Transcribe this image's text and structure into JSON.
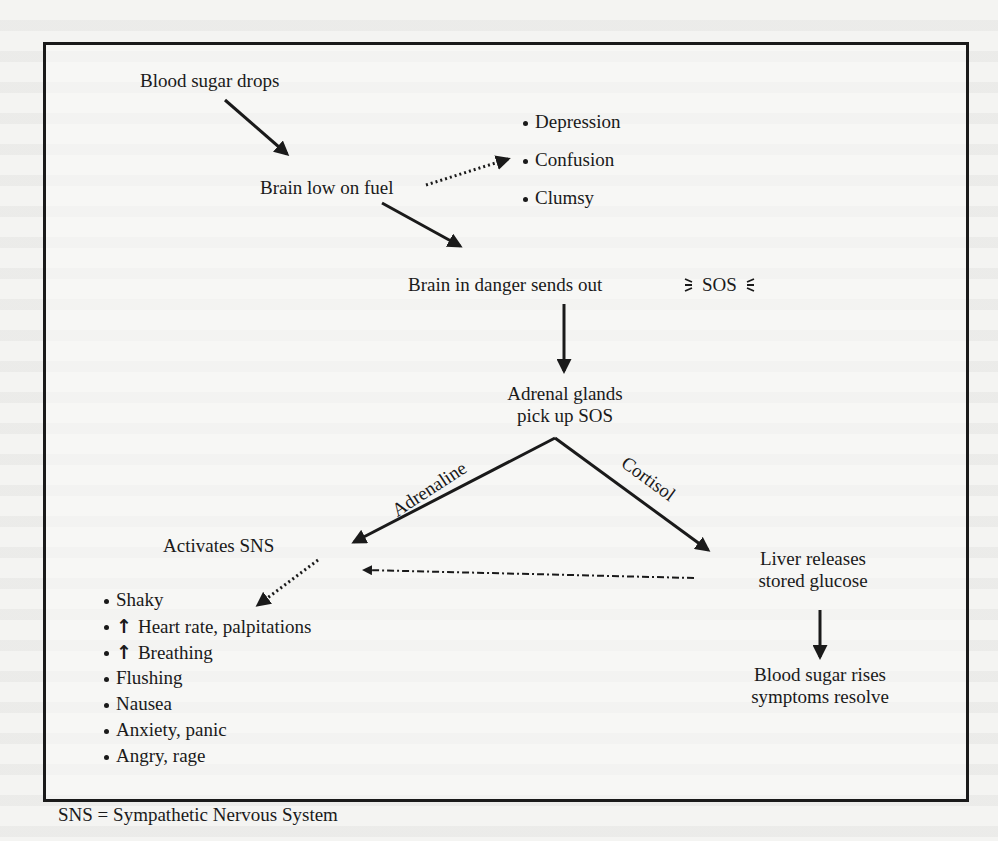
{
  "figure": {
    "nodes": {
      "blood_sugar_drops": "Blood sugar drops",
      "brain_low_on_fuel": "Brain low on fuel",
      "brain_in_danger": "Brain in danger sends out",
      "sos": "SOS",
      "adrenal_glands_line1": "Adrenal glands",
      "adrenal_glands_line2": "pick up SOS",
      "activates_sns": "Activates SNS",
      "liver_line1": "Liver releases",
      "liver_line2": "stored glucose",
      "resolve_line1": "Blood sugar rises",
      "resolve_line2": "symptoms resolve"
    },
    "edge_labels": {
      "adrenaline": "Adrenaline",
      "cortisol": "Cortisol"
    },
    "brain_symptoms": [
      "Depression",
      "Confusion",
      "Clumsy"
    ],
    "sns_symptoms": [
      {
        "prefix": "",
        "text": "Shaky"
      },
      {
        "prefix": "↑",
        "text": "Heart rate, palpitations"
      },
      {
        "prefix": "↑",
        "text": "Breathing"
      },
      {
        "prefix": "",
        "text": "Flushing"
      },
      {
        "prefix": "",
        "text": "Nausea"
      },
      {
        "prefix": "",
        "text": "Anxiety, panic"
      },
      {
        "prefix": "",
        "text": "Angry, rage"
      }
    ],
    "footnote": "SNS = Sympathetic Nervous System"
  }
}
